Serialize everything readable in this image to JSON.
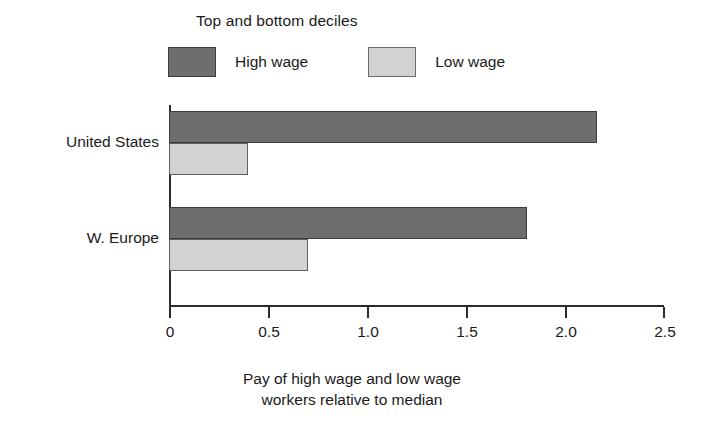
{
  "chart_data": {
    "type": "bar",
    "orientation": "horizontal",
    "title": "",
    "legend_title": "Top and bottom deciles",
    "legend_position": "top-left",
    "categories": [
      "United States",
      "W. Europe"
    ],
    "series": [
      {
        "name": "High wage",
        "color": "#6e6e6e",
        "values": [
          2.16,
          1.81
        ]
      },
      {
        "name": "Low wage",
        "color": "#d2d2d2",
        "values": [
          0.4,
          0.7
        ]
      }
    ],
    "xlabel": "Pay of high wage and low wage workers relative to median",
    "xlabel_line1": "Pay of high wage and low wage",
    "xlabel_line2": "workers relative to median",
    "ylabel": "",
    "xlim": [
      0,
      2.5
    ],
    "xticks": [
      "0",
      "0.5",
      "1.0",
      "1.5",
      "2.0",
      "2.5"
    ],
    "xtick_values": [
      0,
      0.5,
      1.0,
      1.5,
      2.0,
      2.5
    ],
    "grid": false
  },
  "colors": {
    "high_wage": "#6e6e6e",
    "low_wage": "#d2d2d2",
    "axis": "#2b2b2b",
    "background": "#ffffff"
  }
}
